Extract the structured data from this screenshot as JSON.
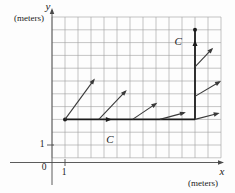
{
  "figure": {
    "background": "#fdfdfd",
    "axes": {
      "y_variable": "y",
      "y_unit": "(meters)",
      "x_variable": "x",
      "x_unit": "(meters)",
      "origin": "0",
      "x_tick": "1",
      "y_tick": "1",
      "color": "#4a4a4a"
    },
    "grid": {
      "cols": 13,
      "rows": 11,
      "left": 52,
      "top": 17,
      "cell_w": 13,
      "cell_h": 12.8,
      "color": "#9e9e9e"
    },
    "path": {
      "color": "#1c1c1c",
      "points": [
        [
          1,
          3
        ],
        [
          11,
          3
        ],
        [
          11,
          10
        ]
      ],
      "dots": [
        [
          1,
          3
        ],
        [
          11,
          10
        ]
      ],
      "arrowheads": [
        {
          "at": [
            4.6,
            3
          ],
          "dir": "right"
        },
        {
          "at": [
            11,
            9.2
          ],
          "dir": "up"
        }
      ]
    },
    "vectors": {
      "color": "#3a3a3a",
      "items": [
        {
          "tail": [
            1,
            3
          ],
          "tip": [
            3.3,
            6.2
          ]
        },
        {
          "tail": [
            3.6,
            3
          ],
          "tip": [
            5.75,
            5.3
          ]
        },
        {
          "tail": [
            6.2,
            3
          ],
          "tip": [
            8.1,
            4.3
          ]
        },
        {
          "tail": [
            8.3,
            3
          ],
          "tip": [
            10.3,
            3.55
          ]
        },
        {
          "tail": [
            11,
            3
          ],
          "tip": [
            12.9,
            3.5
          ]
        },
        {
          "tail": [
            11,
            4.8
          ],
          "tip": [
            13.0,
            6.0
          ]
        },
        {
          "tail": [
            11,
            7.1
          ],
          "tip": [
            12.4,
            8.6
          ]
        }
      ]
    },
    "point_labels": [
      {
        "text": "C",
        "pos": [
          4.45,
          1.45
        ]
      },
      {
        "text": "C",
        "pos": [
          9.7,
          9.15
        ]
      }
    ]
  }
}
